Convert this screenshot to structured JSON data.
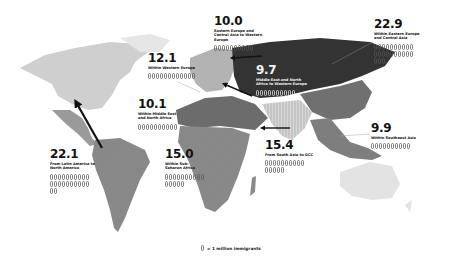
{
  "map": {
    "colors": {
      "background": "#ffffff",
      "north_america": "#cfcfcf",
      "central_america": "#9a9a9a",
      "south_america": "#8e8e8e",
      "europe": "#b3b3b3",
      "eastern_europe_central_asia": "#333333",
      "middle_east_north_africa": "#6c6c6c",
      "sub_saharan_africa": "#8a8a8a",
      "south_asia": "#c8c8c8",
      "east_asia": "#707070",
      "southeast_asia": "#7e7e7e",
      "oceania": "#e3e3e3",
      "arrow": "#111111"
    }
  },
  "flows": [
    {
      "id": "eeca-weu",
      "value": "10.0",
      "label": "Eastern Europe and Central Asia to Western Europe",
      "icons": 10
    },
    {
      "id": "within-weu",
      "value": "12.1",
      "label": "Within Western Europe",
      "icons": 12
    },
    {
      "id": "within-eeca",
      "value": "22.9",
      "label": "Within Eastern Europe and Central Asia",
      "icons": 23
    },
    {
      "id": "mena-weu",
      "value": "9.7",
      "label": "Middle East and North Africa to Western Europe",
      "icons": 10
    },
    {
      "id": "within-mena",
      "value": "10.1",
      "label": "Within Middle East and North Africa",
      "icons": 10
    },
    {
      "id": "within-sea",
      "value": "9.9",
      "label": "Within Southeast Asia",
      "icons": 10
    },
    {
      "id": "latam-na",
      "value": "22.1",
      "label": "From Latin America to North America",
      "icons": 22
    },
    {
      "id": "within-ssa",
      "value": "15.0",
      "label": "Within Sub-Saharan Africa",
      "icons": 15
    },
    {
      "id": "sa-gcc",
      "value": "15.4",
      "label": "From South Asia to GCC",
      "icons": 15
    }
  ],
  "legend": {
    "icon": "person-icon",
    "text": "= 1 million immigrants"
  }
}
